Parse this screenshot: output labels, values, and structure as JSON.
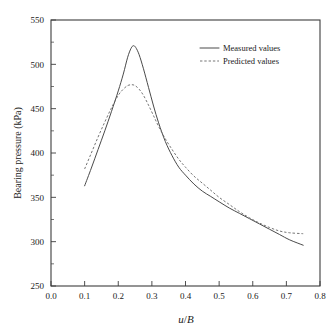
{
  "chart_data": {
    "type": "line",
    "title": "",
    "xlabel": "u/B",
    "xlabel_parts": {
      "italic_u": "u",
      "slash": "/",
      "italic_b": "B"
    },
    "ylabel": "Bearing pressure (kPa)",
    "xlim": [
      0.0,
      0.8
    ],
    "ylim": [
      250,
      550
    ],
    "x_ticks": [
      0.0,
      0.1,
      0.2,
      0.3,
      0.4,
      0.5,
      0.6,
      0.7,
      0.8
    ],
    "x_tick_labels": [
      "0.0",
      "0.1",
      "0.2",
      "0.3",
      "0.4",
      "0.5",
      "0.6",
      "0.7",
      "0.8"
    ],
    "y_ticks": [
      250,
      300,
      350,
      400,
      450,
      500,
      550
    ],
    "y_tick_labels": [
      "250",
      "300",
      "350",
      "400",
      "450",
      "500",
      "550"
    ],
    "y_minor_ticks": [
      275,
      325,
      375,
      425,
      475,
      525
    ],
    "grid": false,
    "legend_position": "top-right",
    "series": [
      {
        "name": "Measured values",
        "style": "solid",
        "color": "#4a4a4a",
        "x": [
          0.1,
          0.12,
          0.14,
          0.16,
          0.18,
          0.2,
          0.215,
          0.228,
          0.238,
          0.245,
          0.252,
          0.262,
          0.275,
          0.29,
          0.305,
          0.32,
          0.34,
          0.36,
          0.38,
          0.4,
          0.425,
          0.45,
          0.475,
          0.5,
          0.53,
          0.56,
          0.59,
          0.62,
          0.65,
          0.68,
          0.71,
          0.75
        ],
        "y": [
          363,
          383,
          404,
          425,
          447,
          470,
          489,
          508,
          518,
          521,
          519,
          511,
          495,
          474,
          453,
          434,
          413,
          397,
          384,
          375,
          365,
          357,
          351,
          345,
          338,
          332,
          326,
          320,
          314,
          308,
          302,
          296
        ]
      },
      {
        "name": "Predicted values",
        "style": "dashed",
        "color": "#6e6e6e",
        "x": [
          0.1,
          0.12,
          0.14,
          0.16,
          0.18,
          0.2,
          0.215,
          0.228,
          0.24,
          0.25,
          0.262,
          0.275,
          0.29,
          0.305,
          0.32,
          0.34,
          0.36,
          0.38,
          0.4,
          0.425,
          0.45,
          0.475,
          0.5,
          0.53,
          0.56,
          0.59,
          0.62,
          0.65,
          0.68,
          0.71,
          0.75
        ],
        "y": [
          382,
          400,
          418,
          435,
          451,
          465,
          472,
          476,
          477,
          476,
          472,
          465,
          454,
          442,
          430,
          416,
          404,
          393,
          384,
          374,
          366,
          358,
          350,
          342,
          334,
          327,
          321,
          316,
          312,
          310,
          309
        ]
      }
    ],
    "legend": [
      {
        "label": "Measured values",
        "style": "solid",
        "color": "#4a4a4a"
      },
      {
        "label": "Predicted values",
        "style": "dashed",
        "color": "#6e6e6e"
      }
    ]
  },
  "plot_geometry": {
    "left": 51,
    "right": 320,
    "top": 20,
    "bottom": 286
  },
  "legend_geometry": {
    "sample_x1": 200,
    "sample_x2": 219,
    "text_x": 223,
    "row1_y": 48,
    "row2_y": 61
  }
}
